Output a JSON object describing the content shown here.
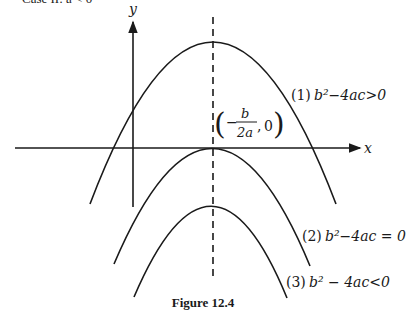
{
  "header": {
    "title_fragment": "Case II: a < 0"
  },
  "axes": {
    "x_label": "x",
    "y_label": "y"
  },
  "vertex_label": {
    "open": "(",
    "minus": "−",
    "numerator": "b",
    "denominator": "2a",
    "tail": ", 0)"
  },
  "curves": [
    {
      "id": 1,
      "label_num": "(1)",
      "label_expr": "b²−4ac>0"
    },
    {
      "id": 2,
      "label_num": "(2)",
      "label_expr": "b²−4ac = 0"
    },
    {
      "id": 3,
      "label_num": "(3)",
      "label_expr": "b² − 4ac<0"
    }
  ],
  "caption": "Figure 12.4"
}
